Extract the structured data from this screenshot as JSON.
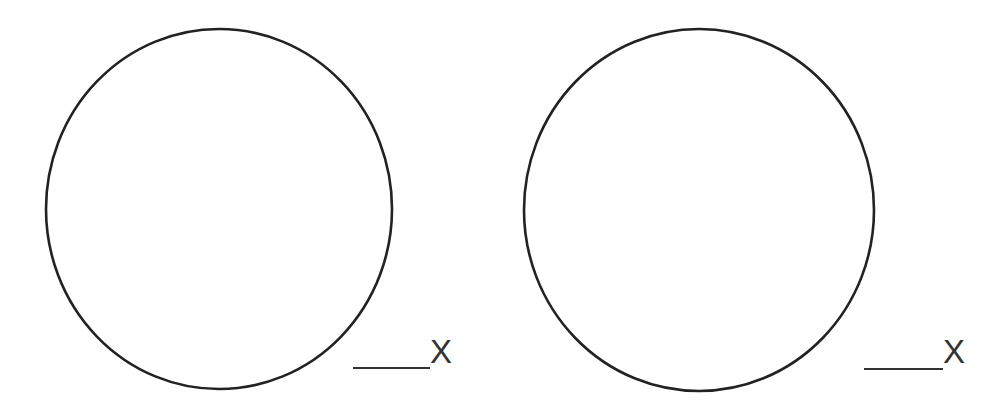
{
  "diagram": {
    "background": "#ffffff",
    "stroke_color": "#222222",
    "label_color": "#333333",
    "figures": [
      {
        "shape": "circle",
        "center": [
          219,
          209
        ],
        "rx": 173,
        "ry": 180,
        "answer_blank": {
          "x1": 353,
          "x2": 430,
          "y": 368,
          "label": "X"
        }
      },
      {
        "shape": "circle",
        "center": [
          699,
          210
        ],
        "rx": 175,
        "ry": 181,
        "answer_blank": {
          "x1": 864,
          "x2": 943,
          "y": 369,
          "label": "X"
        }
      }
    ]
  }
}
